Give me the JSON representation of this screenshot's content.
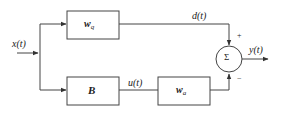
{
  "diagram": {
    "type": "block-diagram",
    "input": {
      "label": "x(t)"
    },
    "blocks": [
      {
        "id": "wq",
        "label": "w",
        "subscript": "q"
      },
      {
        "id": "B",
        "label": "B"
      },
      {
        "id": "wa",
        "label": "w",
        "subscript": "a"
      }
    ],
    "signals": {
      "d": "d(t)",
      "u": "u(t)",
      "y": "y(t)"
    },
    "summer": {
      "symbol": "Σ",
      "plus_sign": "+",
      "minus_sign": "−"
    }
  }
}
